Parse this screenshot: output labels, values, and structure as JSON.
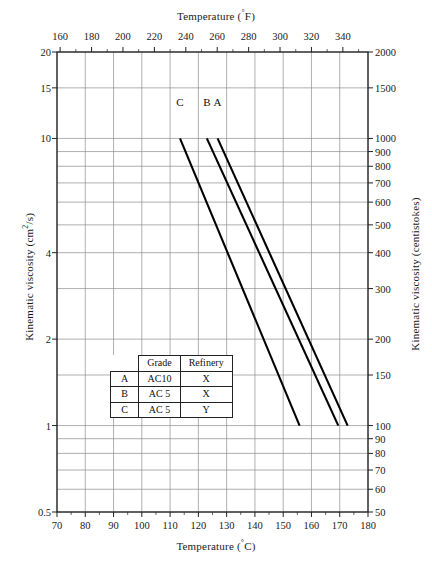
{
  "chart_data": {
    "type": "line",
    "title": "",
    "xlabel": "Temperature (°C)",
    "xlabel_top": "Temperature (°F)",
    "ylabel": "Kinematic viscosity (cm²/s)",
    "ylabel_right": "Kinematic viscosity (centistokes)",
    "xlim": [
      70,
      180
    ],
    "ylim": [
      0.5,
      20
    ],
    "yscale": "log",
    "xscale": "linear",
    "grid": true,
    "legend_position": "inside-lower-left",
    "xticks": [
      70,
      80,
      90,
      100,
      110,
      120,
      130,
      140,
      150,
      160,
      170,
      180
    ],
    "xticklabels": [
      "70",
      "80",
      "90",
      "100",
      "110",
      "120",
      "130",
      "140",
      "150",
      "160",
      "170",
      "180"
    ],
    "xticks_top_f": [
      160,
      180,
      200,
      220,
      240,
      260,
      280,
      300,
      320,
      340
    ],
    "xticklabels_top_f": [
      "160",
      "180",
      "200",
      "220",
      "240",
      "260",
      "280",
      "300",
      "320",
      "340"
    ],
    "yticks": [
      0.5,
      1,
      2,
      4,
      10,
      15,
      20
    ],
    "yticklabels": [
      "0.5",
      "1",
      "2",
      "4",
      "10",
      "15",
      "20"
    ],
    "yticks_right_cst": [
      50,
      60,
      70,
      80,
      90,
      100,
      150,
      200,
      300,
      400,
      500,
      600,
      700,
      800,
      900,
      1000,
      1500,
      2000
    ],
    "yticklabels_right_cst": [
      "50",
      "60",
      "70",
      "80",
      "90",
      "100",
      "150",
      "200",
      "300",
      "400",
      "500",
      "600",
      "700",
      "800",
      "900",
      "1000",
      "1500",
      "2000"
    ],
    "series": [
      {
        "name": "A",
        "label": "A",
        "grade": "AC10",
        "refinery": "X",
        "color": "#000000",
        "points": [
          [
            126.8,
            10.0
          ],
          [
            172.8,
            1.0
          ]
        ]
      },
      {
        "name": "B",
        "label": "B",
        "grade": "AC 5",
        "refinery": "X",
        "color": "#000000",
        "points": [
          [
            123.0,
            10.0
          ],
          [
            169.5,
            1.0
          ]
        ]
      },
      {
        "name": "C",
        "label": "C",
        "grade": "AC 5",
        "refinery": "Y",
        "color": "#000000",
        "points": [
          [
            113.5,
            10.0
          ],
          [
            155.8,
            1.0
          ]
        ]
      }
    ],
    "curve_labels": [
      {
        "text": "C",
        "x": 113.5,
        "y_px_top": 96
      },
      {
        "text": "B",
        "x": 123.0,
        "y_px_top": 96
      },
      {
        "text": "A",
        "x": 126.8,
        "y_px_top": 96
      }
    ]
  },
  "legend": {
    "corner": "",
    "headers": [
      "Grade",
      "Refinery"
    ],
    "rows": [
      {
        "key": "A",
        "grade": "AC10",
        "refinery": "X"
      },
      {
        "key": "B",
        "grade": "AC 5",
        "refinery": "X"
      },
      {
        "key": "C",
        "grade": "AC 5",
        "refinery": "Y"
      }
    ]
  },
  "labels": {
    "top_axis_title_main": "Temperature (",
    "top_axis_title_unit": "°",
    "top_axis_title_tail": "F)",
    "bottom_axis_title_main": "Temperature (",
    "bottom_axis_title_unit": "°",
    "bottom_axis_title_tail": "C)",
    "left_axis_title_main": "Kinematic viscosity (cm",
    "left_axis_title_sup": "2",
    "left_axis_title_tail": "/s)",
    "right_axis_title": "Kinematic viscosity (centistokes)"
  }
}
